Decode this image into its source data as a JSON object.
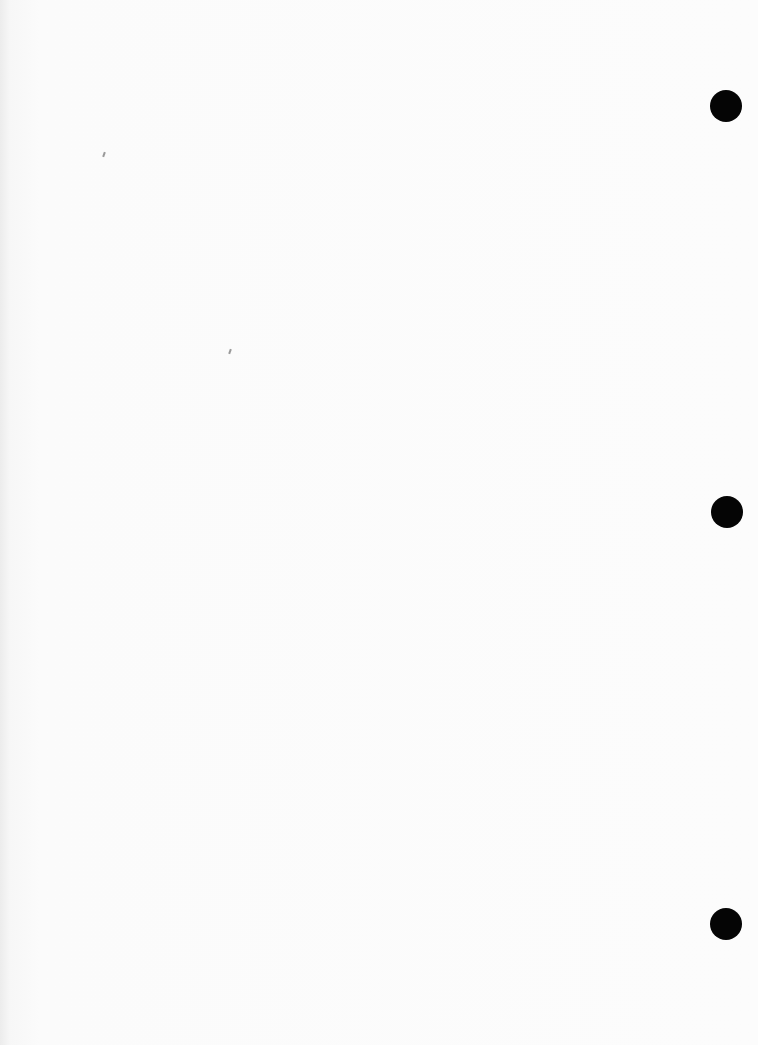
{
  "document": {
    "type": "blank scanned page",
    "text": "",
    "background_color": "#fcfcfc"
  },
  "hole_punches": [
    {
      "cx": 726,
      "cy": 106
    },
    {
      "cx": 727,
      "cy": 512
    },
    {
      "cx": 726,
      "cy": 924
    }
  ]
}
